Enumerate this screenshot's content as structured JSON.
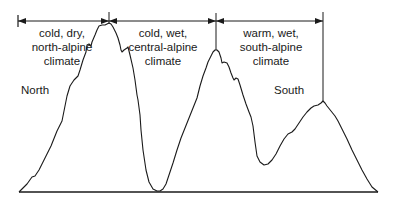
{
  "diagram": {
    "type": "alpine cross-section climate zones",
    "zones": [
      {
        "id": "north",
        "lines": [
          "cold, dry,",
          "north-alpine",
          "climate"
        ]
      },
      {
        "id": "central",
        "lines": [
          "cold, wet,",
          "central-alpine",
          "climate"
        ]
      },
      {
        "id": "south",
        "lines": [
          "warm, wet,",
          "south-alpine",
          "climate"
        ]
      }
    ],
    "side_labels": {
      "north": "North",
      "south": "South"
    },
    "colors": {
      "line": "#1a1a1a",
      "background": "#ffffff"
    }
  }
}
